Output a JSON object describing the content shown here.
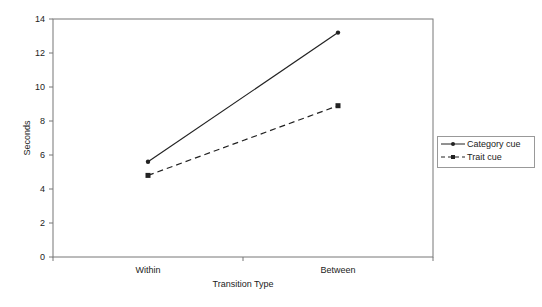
{
  "chart_data": {
    "type": "line",
    "title": "",
    "xlabel": "Transition Type",
    "ylabel": "Seconds",
    "categories": [
      "Within",
      "Between"
    ],
    "series": [
      {
        "name": "Category cue",
        "values": [
          5.6,
          13.2
        ],
        "line_style": "solid",
        "marker": "circle",
        "color": "#222222"
      },
      {
        "name": "Trait cue",
        "values": [
          4.8,
          8.9
        ],
        "line_style": "dashed",
        "marker": "square",
        "color": "#222222"
      }
    ],
    "ylim": [
      0,
      14
    ],
    "yticks": [
      0,
      2,
      4,
      6,
      8,
      10,
      12,
      14
    ],
    "grid": false,
    "legend_position": "right"
  },
  "legend": {
    "items": [
      "Category cue",
      "Trait cue"
    ]
  }
}
